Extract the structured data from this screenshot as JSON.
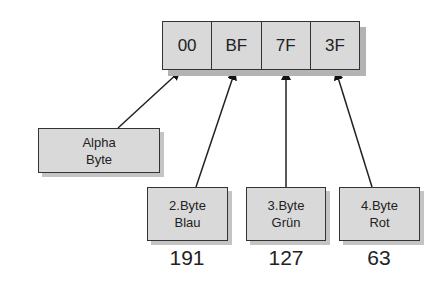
{
  "diagram": {
    "bytes": [
      "00",
      "BF",
      "7F",
      "3F"
    ],
    "boxes": [
      {
        "line1": "Alpha",
        "line2": "Byte"
      },
      {
        "line1": "2.Byte",
        "line2": "Blau",
        "value": "191"
      },
      {
        "line1": "3.Byte",
        "line2": "Grün",
        "value": "127"
      },
      {
        "line1": "4.Byte",
        "line2": "Rot",
        "value": "63"
      }
    ],
    "colors": {
      "fill": "#d9d9d9",
      "border": "#333333",
      "shadow": "#b3b3b3"
    }
  }
}
